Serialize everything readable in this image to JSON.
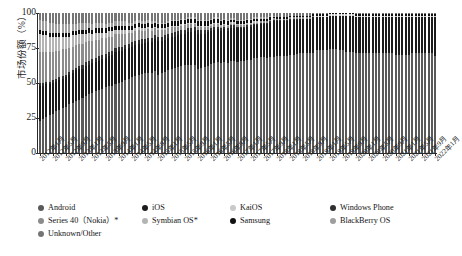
{
  "chart_data": {
    "type": "bar",
    "title": "",
    "xlabel": "",
    "ylabel": "市场份额（%）",
    "ylim": [
      0,
      100
    ],
    "yticks": [
      0,
      25,
      50,
      75,
      100
    ],
    "grid": false,
    "legend_position": "bottom",
    "stacked": true,
    "stack_order_bottom_to_top": [
      "Android",
      "iOS",
      "KaiOS",
      "Windows Phone",
      "Series 40（Nokia）*",
      "Symbian OS*",
      "Samsung",
      "BlackBerry OS",
      "Unknown/Other"
    ],
    "x_tick_labels": [
      "2012年1月",
      "2012年5月",
      "2012年9月",
      "2013年1月",
      "2013年5月",
      "2013年9月",
      "2014年1月",
      "2014年5月",
      "2014年9月",
      "2015年1月",
      "2015年5月",
      "2015年9月",
      "2016年1月",
      "2016年5月",
      "2016年9月",
      "2017年1月",
      "2017年5月",
      "2017年9月",
      "2018年1月",
      "2018年5月",
      "2018年9月",
      "2019年1月",
      "2019年5月",
      "2019年9月",
      "2020年1月",
      "2020年5月",
      "2020年9月",
      "2021年1月",
      "2021年5月",
      "2021年9月",
      "2022年1月"
    ],
    "categories": [
      "2012年1月",
      "2012年2月",
      "2012年3月",
      "2012年4月",
      "2012年5月",
      "2012年6月",
      "2012年7月",
      "2012年8月",
      "2012年9月",
      "2012年10月",
      "2012年11月",
      "2012年12月",
      "2013年1月",
      "2013年2月",
      "2013年3月",
      "2013年4月",
      "2013年5月",
      "2013年6月",
      "2013年7月",
      "2013年8月",
      "2013年9月",
      "2013年10月",
      "2013年11月",
      "2013年12月",
      "2014年1月",
      "2014年2月",
      "2014年3月",
      "2014年4月",
      "2014年5月",
      "2014年6月",
      "2014年7月",
      "2014年8月",
      "2014年9月",
      "2014年10月",
      "2014年11月",
      "2014年12月",
      "2015年1月",
      "2015年2月",
      "2015年3月",
      "2015年4月",
      "2015年5月",
      "2015年6月",
      "2015年7月",
      "2015年8月",
      "2015年9月",
      "2015年10月",
      "2015年11月",
      "2015年12月",
      "2016年1月",
      "2016年2月",
      "2016年3月",
      "2016年4月",
      "2016年5月",
      "2016年6月",
      "2016年7月",
      "2016年8月",
      "2016年9月",
      "2016年10月",
      "2016年11月",
      "2016年12月",
      "2017年1月",
      "2017年2月",
      "2017年3月",
      "2017年4月",
      "2017年5月",
      "2017年6月",
      "2017年7月",
      "2017年8月",
      "2017年9月",
      "2017年10月",
      "2017年11月",
      "2017年12月",
      "2018年1月",
      "2018年2月",
      "2018年3月",
      "2018年4月",
      "2018年5月",
      "2018年6月",
      "2018年7月",
      "2018年8月",
      "2018年9月",
      "2018年10月",
      "2018年11月",
      "2018年12月",
      "2019年1月",
      "2019年2月",
      "2019年3月",
      "2019年4月",
      "2019年5月",
      "2019年6月",
      "2019年7月",
      "2019年8月",
      "2019年9月",
      "2019年10月",
      "2019年11月",
      "2019年12月",
      "2020年1月",
      "2020年2月",
      "2020年3月",
      "2020年4月",
      "2020年5月",
      "2020年6月",
      "2020年7月",
      "2020年8月",
      "2020年9月",
      "2020年10月",
      "2020年11月",
      "2020年12月",
      "2021年1月",
      "2021年2月",
      "2021年3月",
      "2021年4月",
      "2021年5月",
      "2021年6月",
      "2021年7月",
      "2021年8月",
      "2021年9月",
      "2021年10月",
      "2021年11月",
      "2021年12月",
      "2022年1月"
    ],
    "series": [
      {
        "name": "Android",
        "color": "#5a5a5a",
        "values": [
          23,
          24,
          26,
          27,
          28,
          30,
          31,
          32,
          33,
          35,
          36,
          37,
          38,
          39,
          41,
          42,
          43,
          44,
          45,
          46,
          47,
          48,
          48,
          49,
          50,
          51,
          52,
          53,
          54,
          55,
          56,
          57,
          58,
          59,
          59,
          60,
          56,
          57,
          58,
          59,
          60,
          61,
          62,
          63,
          64,
          64,
          65,
          65,
          60,
          61,
          62,
          63,
          64,
          65,
          66,
          66,
          67,
          67,
          68,
          68,
          66,
          67,
          67,
          68,
          68,
          69,
          69,
          70,
          70,
          70,
          71,
          71,
          69,
          69,
          70,
          70,
          71,
          71,
          72,
          72,
          72,
          73,
          73,
          73,
          74,
          74,
          74,
          74,
          75,
          75,
          75,
          74,
          74,
          73,
          73,
          73,
          72,
          72,
          72,
          72,
          72,
          72,
          72,
          72,
          72,
          72,
          72,
          72,
          71,
          71,
          71,
          71,
          71,
          72,
          72,
          72,
          72,
          72,
          72,
          72,
          70
        ]
      },
      {
        "name": "iOS",
        "color": "#1c1c1c",
        "values": [
          25,
          24,
          23,
          22,
          22,
          21,
          21,
          21,
          21,
          21,
          21,
          22,
          22,
          21,
          21,
          21,
          21,
          21,
          21,
          21,
          21,
          21,
          22,
          23,
          23,
          22,
          22,
          22,
          22,
          22,
          22,
          22,
          22,
          23,
          23,
          24,
          24,
          23,
          23,
          23,
          23,
          23,
          23,
          23,
          23,
          24,
          24,
          25,
          25,
          24,
          24,
          24,
          24,
          24,
          24,
          24,
          24,
          24,
          25,
          25,
          25,
          24,
          24,
          24,
          24,
          24,
          24,
          24,
          24,
          25,
          25,
          26,
          25,
          25,
          25,
          25,
          25,
          25,
          25,
          25,
          25,
          25,
          25,
          26,
          24,
          24,
          24,
          24,
          24,
          24,
          24,
          25,
          25,
          26,
          26,
          26,
          26,
          26,
          26,
          26,
          26,
          26,
          26,
          26,
          26,
          26,
          26,
          26,
          27,
          27,
          27,
          27,
          27,
          26,
          26,
          26,
          26,
          26,
          26,
          26,
          28
        ]
      },
      {
        "name": "KaiOS",
        "color": "#c9c9c9",
        "values": [
          0,
          0,
          0,
          0,
          0,
          0,
          0,
          0,
          0,
          0,
          0,
          0,
          0,
          0,
          0,
          0,
          0,
          0,
          0,
          0,
          0,
          0,
          0,
          0,
          0,
          0,
          0,
          0,
          0,
          0,
          0,
          0,
          0,
          0,
          0,
          0,
          0,
          0,
          0,
          0,
          0,
          0,
          0,
          0,
          0,
          0,
          0,
          0,
          0,
          0,
          0,
          0,
          0,
          0,
          0,
          0,
          0,
          0,
          0,
          0,
          0,
          0,
          0,
          0,
          0,
          0,
          0,
          0,
          0,
          0,
          0,
          0,
          0,
          0,
          0,
          0,
          0,
          0,
          0,
          0,
          0,
          0,
          0,
          0,
          1,
          1,
          1,
          1,
          1,
          1,
          1,
          1,
          1,
          1,
          1,
          1,
          1,
          1,
          1,
          1,
          1,
          1,
          1,
          1,
          1,
          1,
          1,
          1,
          1,
          1,
          1,
          1,
          1,
          1,
          1,
          1,
          1,
          1,
          1,
          1,
          1
        ]
      },
      {
        "name": "Windows Phone",
        "color": "#2f2f2f",
        "values": [
          2,
          2,
          2,
          2,
          2,
          2,
          2,
          2,
          2,
          2,
          2,
          2,
          2,
          3,
          3,
          3,
          3,
          3,
          3,
          3,
          3,
          3,
          3,
          3,
          3,
          3,
          3,
          3,
          3,
          3,
          3,
          3,
          3,
          3,
          3,
          3,
          3,
          3,
          3,
          3,
          3,
          3,
          3,
          3,
          3,
          3,
          3,
          3,
          3,
          3,
          3,
          2,
          2,
          2,
          2,
          2,
          2,
          2,
          2,
          2,
          1,
          1,
          1,
          1,
          1,
          1,
          1,
          1,
          1,
          1,
          1,
          1,
          1,
          1,
          1,
          1,
          1,
          1,
          1,
          0,
          0,
          0,
          0,
          0,
          0,
          0,
          0,
          0,
          0,
          0,
          0,
          0,
          0,
          0,
          0,
          0,
          0,
          0,
          0,
          0,
          0,
          0,
          0,
          0,
          0,
          0,
          0,
          0,
          0,
          0,
          0,
          0,
          0,
          0,
          0,
          0,
          0,
          0,
          0,
          0,
          0
        ]
      },
      {
        "name": "Series 40（Nokia）*",
        "color": "#8c8c8c",
        "values": [
          22,
          22,
          21,
          21,
          20,
          20,
          19,
          19,
          18,
          17,
          17,
          16,
          16,
          15,
          14,
          14,
          13,
          13,
          12,
          12,
          11,
          11,
          10,
          10,
          9,
          9,
          8,
          8,
          7,
          7,
          7,
          6,
          6,
          6,
          5,
          5,
          5,
          5,
          4,
          4,
          4,
          4,
          3,
          3,
          3,
          3,
          3,
          2,
          2,
          2,
          2,
          2,
          2,
          2,
          2,
          1,
          1,
          1,
          1,
          1,
          1,
          1,
          1,
          1,
          1,
          1,
          1,
          1,
          1,
          1,
          1,
          1,
          1,
          1,
          1,
          1,
          1,
          1,
          1,
          1,
          1,
          1,
          1,
          1,
          0,
          0,
          0,
          0,
          0,
          0,
          0,
          0,
          0,
          0,
          0,
          0,
          0,
          0,
          0,
          0,
          0,
          0,
          0,
          0,
          0,
          0,
          0,
          0,
          0,
          0,
          0,
          0,
          0,
          0,
          0,
          0,
          0,
          0,
          0,
          0,
          0
        ]
      },
      {
        "name": "Symbian OS*",
        "color": "#b4b4b4",
        "values": [
          13,
          12,
          12,
          11,
          11,
          10,
          10,
          9,
          9,
          8,
          8,
          7,
          7,
          7,
          6,
          6,
          5,
          5,
          5,
          4,
          4,
          4,
          4,
          3,
          3,
          3,
          3,
          2,
          2,
          2,
          2,
          2,
          2,
          2,
          2,
          1,
          1,
          1,
          1,
          1,
          1,
          1,
          1,
          1,
          1,
          1,
          1,
          1,
          1,
          1,
          1,
          1,
          1,
          1,
          1,
          1,
          1,
          1,
          1,
          1,
          1,
          1,
          1,
          1,
          1,
          1,
          1,
          0,
          0,
          0,
          0,
          0,
          0,
          0,
          0,
          0,
          0,
          0,
          0,
          0,
          0,
          0,
          0,
          0,
          0,
          0,
          0,
          0,
          0,
          0,
          0,
          0,
          0,
          0,
          0,
          0,
          0,
          0,
          0,
          0,
          0,
          0,
          0,
          0,
          0,
          0,
          0,
          0,
          0,
          0,
          0,
          0,
          0,
          0,
          0,
          0,
          0,
          0,
          0,
          0,
          0
        ]
      },
      {
        "name": "Samsung",
        "color": "#111111",
        "values": [
          3,
          3,
          3,
          3,
          3,
          3,
          3,
          3,
          3,
          3,
          3,
          3,
          3,
          3,
          3,
          3,
          3,
          3,
          3,
          3,
          3,
          3,
          3,
          3,
          3,
          3,
          3,
          3,
          3,
          3,
          3,
          3,
          3,
          3,
          3,
          3,
          3,
          3,
          3,
          3,
          3,
          3,
          3,
          3,
          3,
          3,
          3,
          3,
          3,
          3,
          3,
          3,
          3,
          3,
          3,
          3,
          3,
          3,
          2,
          2,
          2,
          2,
          2,
          2,
          2,
          2,
          2,
          2,
          2,
          2,
          2,
          1,
          1,
          1,
          1,
          1,
          1,
          1,
          1,
          1,
          1,
          1,
          1,
          1,
          1,
          1,
          1,
          1,
          1,
          1,
          1,
          1,
          1,
          1,
          1,
          1,
          1,
          1,
          1,
          1,
          1,
          1,
          1,
          1,
          1,
          1,
          1,
          1,
          1,
          1,
          1,
          1,
          1,
          1,
          1,
          1,
          1,
          1,
          1,
          1,
          1
        ]
      },
      {
        "name": "BlackBerry OS",
        "color": "#9e9e9e",
        "values": [
          7,
          7,
          7,
          7,
          7,
          6,
          6,
          6,
          6,
          6,
          5,
          5,
          5,
          5,
          5,
          4,
          4,
          4,
          4,
          4,
          3,
          3,
          3,
          3,
          3,
          3,
          3,
          2,
          2,
          2,
          2,
          2,
          2,
          2,
          2,
          1,
          1,
          1,
          1,
          1,
          1,
          1,
          1,
          1,
          1,
          1,
          1,
          1,
          1,
          1,
          1,
          1,
          1,
          1,
          1,
          1,
          1,
          1,
          1,
          1,
          1,
          1,
          1,
          1,
          1,
          1,
          1,
          1,
          1,
          1,
          1,
          1,
          0,
          0,
          0,
          0,
          0,
          0,
          0,
          0,
          0,
          0,
          0,
          0,
          0,
          0,
          0,
          0,
          0,
          0,
          0,
          0,
          0,
          0,
          0,
          0,
          0,
          0,
          0,
          0,
          0,
          0,
          0,
          0,
          0,
          0,
          0,
          0,
          0,
          0,
          0,
          0,
          0,
          0,
          0,
          0,
          0,
          0,
          0,
          0,
          0
        ]
      },
      {
        "name": "Unknown/Other",
        "color": "#757575",
        "values": [
          5,
          6,
          6,
          7,
          7,
          8,
          8,
          8,
          8,
          8,
          8,
          8,
          7,
          7,
          7,
          7,
          8,
          7,
          7,
          7,
          8,
          7,
          7,
          6,
          6,
          6,
          6,
          7,
          7,
          6,
          5,
          6,
          6,
          5,
          6,
          6,
          7,
          7,
          7,
          6,
          5,
          5,
          5,
          4,
          4,
          3,
          3,
          3,
          5,
          5,
          5,
          5,
          4,
          3,
          3,
          5,
          4,
          5,
          4,
          4,
          5,
          5,
          5,
          4,
          4,
          3,
          3,
          3,
          3,
          3,
          2,
          2,
          3,
          3,
          3,
          3,
          2,
          2,
          2,
          2,
          2,
          2,
          2,
          1,
          1,
          1,
          1,
          1,
          0,
          0,
          0,
          0,
          0,
          0,
          0,
          0,
          1,
          1,
          1,
          1,
          1,
          1,
          1,
          1,
          1,
          1,
          1,
          1,
          1,
          1,
          1,
          1,
          1,
          1,
          1,
          1,
          1,
          1,
          1,
          1,
          1
        ]
      }
    ]
  },
  "axis": {
    "y_label": "市场份额（%）",
    "y_ticks": [
      "100",
      "75",
      "50",
      "25",
      "0"
    ]
  },
  "legend": {
    "items": [
      {
        "label": "Android",
        "color": "#5a5a5a",
        "col": 0,
        "row": 0
      },
      {
        "label": "iOS",
        "color": "#1c1c1c",
        "col": 1,
        "row": 0
      },
      {
        "label": "KaiOS",
        "color": "#c9c9c9",
        "col": 2,
        "row": 0
      },
      {
        "label": "Windows Phone",
        "color": "#2f2f2f",
        "col": 3,
        "row": 0
      },
      {
        "label": "Series 40（Nokia）*",
        "color": "#8c8c8c",
        "col": 0,
        "row": 1
      },
      {
        "label": "Symbian OS*",
        "color": "#b4b4b4",
        "col": 1,
        "row": 1
      },
      {
        "label": "Samsung",
        "color": "#111111",
        "col": 2,
        "row": 1
      },
      {
        "label": "BlackBerry OS",
        "color": "#9e9e9e",
        "col": 3,
        "row": 1
      },
      {
        "label": "Unknown/Other",
        "color": "#757575",
        "col": 0,
        "row": 2
      }
    ]
  }
}
